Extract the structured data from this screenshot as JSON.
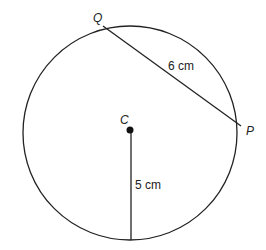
{
  "diagram": {
    "type": "circle-geometry",
    "circle": {
      "center_label": "C",
      "cx": 130,
      "cy": 130,
      "r": 107
    },
    "points": [
      {
        "label": "Q",
        "x": 103,
        "y": 26,
        "label_x": 93,
        "label_y": 22
      },
      {
        "label": "P",
        "x": 241,
        "y": 126,
        "label_x": 246,
        "label_y": 135
      },
      {
        "label": "C",
        "x": 131,
        "y": 130,
        "label_x": 120,
        "label_y": 124
      }
    ],
    "segments": [
      {
        "from": "Q",
        "to": "P",
        "length_label": "6 cm",
        "label_x": 168,
        "label_y": 70
      },
      {
        "from": "C",
        "to": "bottom of circle",
        "length_label": "5 cm",
        "label_x": 135,
        "label_y": 189
      }
    ]
  }
}
